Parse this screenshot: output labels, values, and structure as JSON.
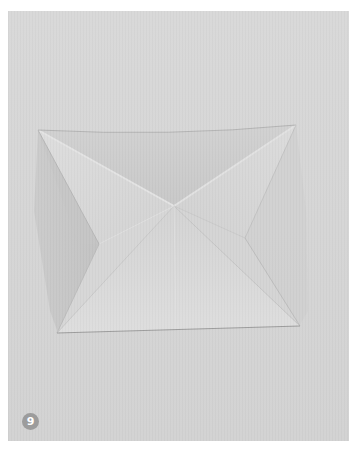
{
  "figure": {
    "step_number": "9",
    "colors": {
      "page_background": "#ffffff",
      "photo_background": "#d6d6d6",
      "badge_fill": "#9c9c9c",
      "badge_text": "#ffffff",
      "paper_top_flap": "#cdcdcd",
      "paper_bottom_flap": "#dcdcdc",
      "paper_left_shadow": "#c2c2c2",
      "paper_right_flank": "#d9d9d9",
      "crease_highlight": "#e6e6e6",
      "edge_line": "#9a9a9a"
    }
  }
}
